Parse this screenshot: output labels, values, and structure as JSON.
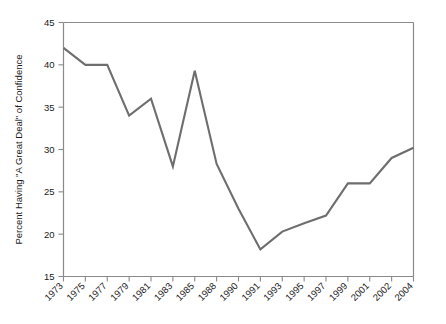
{
  "chart_data": {
    "type": "line",
    "title": "",
    "subtitle": "",
    "xlabel": "",
    "ylabel": "Percent Having \"A Great Deal\" of Confidence",
    "categories": [
      "1973",
      "1975",
      "1977",
      "1979",
      "1981",
      "1983",
      "1985",
      "1988",
      "1990",
      "1991",
      "1993",
      "1995",
      "1997",
      "1999",
      "2001",
      "2002",
      "2004"
    ],
    "values": [
      42.0,
      40.0,
      40.0,
      34.0,
      36.0,
      28.0,
      39.3,
      28.3,
      23.0,
      18.2,
      20.3,
      21.3,
      22.2,
      26.0,
      26.0,
      29.0,
      30.2
    ],
    "series": [
      {
        "name": "Percent Having \"A Great Deal\" of Confidence",
        "values": [
          42.0,
          40.0,
          40.0,
          34.0,
          36.0,
          28.0,
          39.3,
          28.3,
          23.0,
          18.2,
          20.3,
          21.3,
          22.2,
          26.0,
          26.0,
          29.0,
          30.2
        ],
        "color": "#6e6e6e"
      }
    ],
    "ylim": [
      15,
      45
    ],
    "yticks": [
      15,
      20,
      25,
      30,
      35,
      40,
      45
    ],
    "ytick_labels": [
      "15",
      "20",
      "25",
      "30",
      "35",
      "40",
      "45"
    ],
    "grid": false,
    "legend": false,
    "legend_position": "none",
    "line_color": "#6e6e6e",
    "frame_color": "#8a8a8a",
    "xtick_rotation": -45
  }
}
